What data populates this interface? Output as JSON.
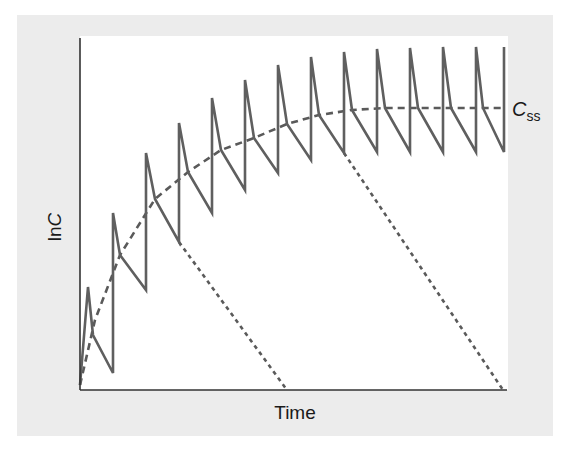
{
  "chart_data": {
    "type": "line",
    "title": "",
    "xlabel": "Time",
    "ylabel": "ln C",
    "ylabel_prefix": "ln",
    "ylabel_var": "C",
    "grid": false,
    "legend": null,
    "annotations": [
      {
        "text": "C",
        "subscript": "ss",
        "meaning": "steady-state concentration",
        "position": "right end of dashed plateau"
      }
    ],
    "colors": {
      "sawtooth": "#5f5f5f",
      "dashed": "#5a5a5a",
      "axis": "#333333",
      "frame": "#ececec"
    },
    "series": [
      {
        "name": "Repeated-dose concentration (sawtooth)",
        "style": "solid",
        "dose_x": [
          80,
          113,
          146,
          179,
          212,
          245,
          278,
          311,
          344,
          377,
          410,
          443,
          476,
          504
        ],
        "points_px": [
          [
            80,
            385
          ],
          [
            88,
            287
          ],
          [
            93,
            335
          ],
          [
            113,
            373
          ],
          [
            113,
            213
          ],
          [
            120,
            255
          ],
          [
            146,
            290
          ],
          [
            146,
            153
          ],
          [
            155,
            199
          ],
          [
            179,
            242
          ],
          [
            179,
            123
          ],
          [
            188,
            172
          ],
          [
            212,
            213
          ],
          [
            212,
            98
          ],
          [
            221,
            150
          ],
          [
            245,
            190
          ],
          [
            245,
            80
          ],
          [
            254,
            138
          ],
          [
            278,
            173
          ],
          [
            278,
            65
          ],
          [
            287,
            124
          ],
          [
            311,
            160
          ],
          [
            311,
            57
          ],
          [
            319,
            115
          ],
          [
            344,
            153
          ],
          [
            344,
            52
          ],
          [
            352,
            110
          ],
          [
            377,
            152
          ],
          [
            377,
            49
          ],
          [
            385,
            108
          ],
          [
            410,
            152
          ],
          [
            410,
            48
          ],
          [
            418,
            108
          ],
          [
            443,
            152
          ],
          [
            443,
            47
          ],
          [
            451,
            108
          ],
          [
            476,
            152
          ],
          [
            476,
            47
          ],
          [
            483,
            108
          ],
          [
            504,
            152
          ],
          [
            504,
            47
          ]
        ]
      },
      {
        "name": "Average concentration approaching Css",
        "style": "dashed",
        "points_px": [
          [
            80,
            385
          ],
          [
            95,
            320
          ],
          [
            120,
            255
          ],
          [
            155,
            199
          ],
          [
            188,
            172
          ],
          [
            221,
            150
          ],
          [
            254,
            138
          ],
          [
            287,
            124
          ],
          [
            319,
            115
          ],
          [
            352,
            110
          ],
          [
            385,
            108
          ],
          [
            420,
            108
          ],
          [
            504,
            108
          ]
        ]
      },
      {
        "name": "Elimination after stopping (early)",
        "style": "dotted",
        "points_px": [
          [
            179,
            242
          ],
          [
            287,
            390
          ]
        ]
      },
      {
        "name": "Elimination after stopping (late)",
        "style": "dotted",
        "points_px": [
          [
            344,
            153
          ],
          [
            503,
            390
          ]
        ]
      }
    ],
    "axes_px": {
      "x0": 80,
      "x1": 507,
      "y0": 390,
      "y1": 36
    }
  }
}
